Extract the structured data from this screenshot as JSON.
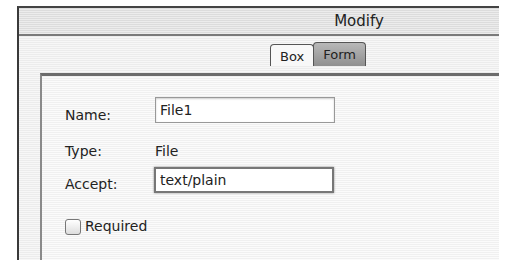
{
  "window": {
    "title": "Modify"
  },
  "tabs": [
    {
      "label": "Box",
      "selected": false
    },
    {
      "label": "Form",
      "selected": true
    }
  ],
  "form": {
    "name": {
      "label": "Name:",
      "value": "File1"
    },
    "type": {
      "label": "Type:",
      "value": "File"
    },
    "accept": {
      "label": "Accept:",
      "value": "text/plain"
    },
    "required": {
      "label": "Required",
      "checked": false
    }
  }
}
